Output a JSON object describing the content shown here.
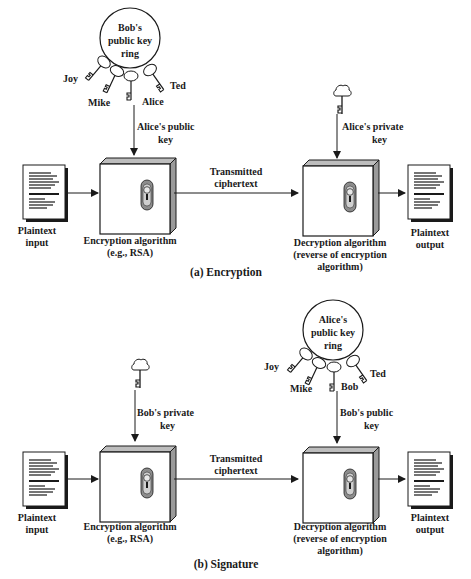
{
  "panels": [
    {
      "caption": "(a) Encryption",
      "key_ring": {
        "title_lines": [
          "Bob's",
          "public key",
          "ring"
        ],
        "keys": [
          "Joy",
          "Mike",
          "Alice",
          "Ted"
        ],
        "position": "left"
      },
      "enc_key_label": [
        "Alice's public",
        "key"
      ],
      "dec_key_label": [
        "Alice's private",
        "key"
      ],
      "input_label": [
        "Plaintext",
        "input"
      ],
      "enc_label": [
        "Encryption algorithm",
        "(e.g., RSA)"
      ],
      "channel_label": [
        "Transmitted",
        "ciphertext"
      ],
      "dec_label": [
        "Decryption algorithm",
        "(reverse of encryption",
        "algorithm)"
      ],
      "output_label": [
        "Plaintext",
        "output"
      ]
    },
    {
      "caption": "(b) Signature",
      "key_ring": {
        "title_lines": [
          "Alice's",
          "public key",
          "ring"
        ],
        "keys": [
          "Joy",
          "Mike",
          "Bob",
          "Ted"
        ],
        "position": "right"
      },
      "enc_key_label": [
        "Bob's private",
        "key"
      ],
      "dec_key_label": [
        "Bob's public",
        "key"
      ],
      "input_label": [
        "Plaintext",
        "input"
      ],
      "enc_label": [
        "Encryption algorithm",
        "(e.g., RSA)"
      ],
      "channel_label": [
        "Transmitted",
        "ciphertext"
      ],
      "dec_label": [
        "Decryption algorithm",
        "(reverse of encryption",
        "algorithm)"
      ],
      "output_label": [
        "Plaintext",
        "output"
      ]
    }
  ],
  "colors": {
    "line": "#1a1a1a",
    "box_side": "#9a9a9a",
    "lock_fill": "#8c8c8c",
    "lock_inner": "#cfcfcf"
  }
}
